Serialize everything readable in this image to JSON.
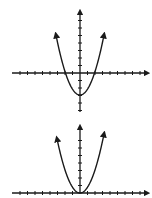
{
  "figure": {
    "stroke_color": "#1a1a1a",
    "background": "#ffffff"
  },
  "graphs": [
    {
      "name": "graph-top",
      "curve": "upward parabola shifted down (vertex below origin)",
      "origin": [
        80,
        73
      ],
      "tick_spacing": 7.5,
      "x_axis": {
        "x_start": 12,
        "x_end": 147
      },
      "y_axis": {
        "y_top": 12,
        "y_bottom": 112
      },
      "vertex": [
        80,
        95
      ],
      "roots": [
        64,
        96
      ],
      "arrows": [
        [
          56,
          35
        ],
        [
          104,
          35
        ]
      ]
    },
    {
      "name": "graph-bottom",
      "curve": "upward parabola with vertex at origin",
      "origin": [
        80,
        193
      ],
      "tick_spacing": 7.5,
      "x_axis": {
        "x_start": 12,
        "x_end": 147
      },
      "y_axis": {
        "y_top": 127,
        "y_bottom": 193
      },
      "vertex": [
        80,
        193
      ],
      "arrows": [
        [
          57,
          134
        ],
        [
          104,
          134
        ]
      ]
    }
  ]
}
